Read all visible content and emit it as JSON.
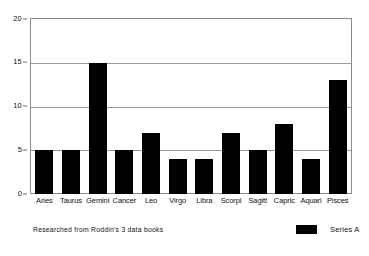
{
  "chart_data": {
    "type": "bar",
    "title": "",
    "subtitle": "",
    "xlabel": "",
    "ylabel": "",
    "categories": [
      "Aries",
      "Taurus",
      "Gemini",
      "Cancer",
      "Leo",
      "Virgo",
      "Libra",
      "Scorpi",
      "Sagitt",
      "Capric",
      "Aquari",
      "Pisces"
    ],
    "series": [
      {
        "name": "Series A",
        "color": "#000000",
        "values": [
          5,
          5,
          15,
          5,
          7,
          4,
          4,
          7,
          5,
          8,
          4,
          13
        ]
      }
    ],
    "ylim": [
      0,
      20
    ],
    "yticks": [
      0,
      5,
      10,
      15,
      20
    ],
    "ytick_labels": [
      "0",
      "5",
      "10",
      "15",
      "20"
    ],
    "grid": "horizontal",
    "legend_position": "bottom-right",
    "annotations": [
      {
        "name": "source-note",
        "text": "Researched from Roddin's 3 data books",
        "position": "bottom-left"
      }
    ],
    "colors": {
      "bar": "#000000",
      "background": "#ffffff",
      "grid": "#9a9a9a",
      "axis": "#8a8a8a",
      "text": "#111111"
    }
  },
  "legend": {
    "entries": [
      {
        "label": "Series A",
        "color": "#000000"
      }
    ]
  },
  "footnote": {
    "text": "Researched from Roddin's 3 data books"
  }
}
